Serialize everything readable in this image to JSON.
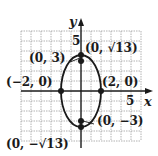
{
  "figure": {
    "axes": {
      "x_label": "x",
      "y_label": "y",
      "x_tick_label": "5",
      "y_tick_label": "5"
    },
    "equation_shape": "vertical ellipse centered at origin",
    "points": [
      {
        "id": "top-vertex",
        "label": "(0, √13)",
        "x": 0,
        "y": 3.606
      },
      {
        "id": "bottom-vertex",
        "label": "(0, −√13)",
        "x": 0,
        "y": -3.606
      },
      {
        "id": "focus-top",
        "label": "(0, 3)",
        "x": 0,
        "y": 3
      },
      {
        "id": "focus-bottom",
        "label": "(0, −3)",
        "x": 0,
        "y": -3
      },
      {
        "id": "left-covertex",
        "label": "(−2, 0)",
        "x": -2,
        "y": 0
      },
      {
        "id": "right-covertex",
        "label": "(2, 0)",
        "x": 2,
        "y": 0
      }
    ],
    "colors": {
      "ink": "#1a1a1a",
      "grid": "#9a9a9a",
      "background": "#ffffff"
    }
  }
}
